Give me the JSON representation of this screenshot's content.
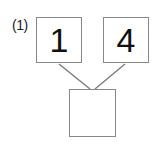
{
  "problem": {
    "label": "(1)",
    "top_left_value": "1",
    "top_right_value": "4",
    "bottom_value": ""
  }
}
